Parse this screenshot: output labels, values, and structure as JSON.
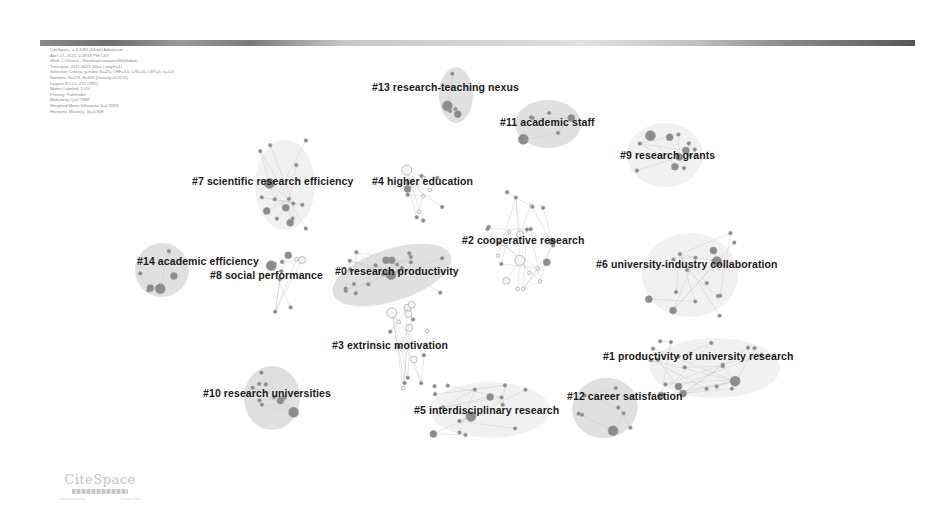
{
  "header": {
    "info_lines": [
      "CiteSpace, v. 6.3.R1 (64-bit) Advanced",
      "April 17, 2024, 4:49:59 PM CST",
      "WoS: C:\\Users\\...\\Desktop\\citespace\\WoS\\data",
      "Timespan: 2011-2023 (Slice Length=1)",
      "Selection Criteria: g-index (k=25), LRF=3.0, L/N=10, LBY=5, e=1.0",
      "Network: N=270, E=624 (Density=0.0172)",
      "Largest 8 CCs: 211 (78%)",
      "Nodes Labeled: 1.0%",
      "Pruning: Pathfinder",
      "Modularity Q=0.7988",
      "Weighted Mean Silhouette S=0.9283",
      "Harmonic Mean(Q, S)=0.858"
    ]
  },
  "clusters": [
    {
      "id": 0,
      "label": "#0 research productivity",
      "x": 335,
      "y": 265,
      "hull": {
        "cx": 392,
        "cy": 275,
        "rx": 62,
        "ry": 26,
        "rot": -18
      }
    },
    {
      "id": 1,
      "label": "#1 productivity of university research",
      "x": 603,
      "y": 350,
      "hull": {
        "cx": 715,
        "cy": 368,
        "rx": 65,
        "ry": 30,
        "rot": 0
      }
    },
    {
      "id": 2,
      "label": "#2 cooperative research",
      "x": 462,
      "y": 234,
      "hull": null
    },
    {
      "id": 3,
      "label": "#3 extrinsic motivation",
      "x": 332,
      "y": 339,
      "hull": null
    },
    {
      "id": 4,
      "label": "#4 higher education",
      "x": 372,
      "y": 175,
      "hull": null
    },
    {
      "id": 5,
      "label": "#5 interdisciplinary research",
      "x": 414,
      "y": 404,
      "hull": {
        "cx": 490,
        "cy": 410,
        "rx": 60,
        "ry": 28,
        "rot": 0
      }
    },
    {
      "id": 6,
      "label": "#6 university-industry collaboration",
      "x": 596,
      "y": 258,
      "hull": {
        "cx": 690,
        "cy": 275,
        "rx": 48,
        "ry": 42,
        "rot": 0
      }
    },
    {
      "id": 7,
      "label": "#7 scientific research efficiency",
      "x": 192,
      "y": 175,
      "hull": {
        "cx": 285,
        "cy": 185,
        "rx": 30,
        "ry": 45,
        "rot": 0
      }
    },
    {
      "id": 8,
      "label": "#8 social performance",
      "x": 210,
      "y": 269,
      "hull": null
    },
    {
      "id": 9,
      "label": "#9 research grants",
      "x": 620,
      "y": 149,
      "hull": {
        "cx": 665,
        "cy": 155,
        "rx": 38,
        "ry": 32,
        "rot": 0
      }
    },
    {
      "id": 10,
      "label": "#10 research universities",
      "x": 203,
      "y": 387,
      "hull": {
        "cx": 272,
        "cy": 398,
        "rx": 28,
        "ry": 32,
        "rot": 0
      }
    },
    {
      "id": 11,
      "label": "#11 academic staff",
      "x": 500,
      "y": 116,
      "hull": {
        "cx": 548,
        "cy": 124,
        "rx": 33,
        "ry": 24,
        "rot": 0
      }
    },
    {
      "id": 12,
      "label": "#12 career satisfaction",
      "x": 567,
      "y": 390,
      "hull": {
        "cx": 605,
        "cy": 408,
        "rx": 33,
        "ry": 30,
        "rot": -15
      }
    },
    {
      "id": 13,
      "label": "#13 research-teaching nexus",
      "x": 372,
      "y": 81,
      "hull": {
        "cx": 456,
        "cy": 95,
        "rx": 17,
        "ry": 28,
        "rot": 0
      }
    },
    {
      "id": 14,
      "label": "#14 academic efficiency",
      "x": 137,
      "y": 255,
      "hull": {
        "cx": 162,
        "cy": 270,
        "rx": 27,
        "ry": 27,
        "rot": 0
      }
    }
  ],
  "logo": {
    "text": "CiteSpace",
    "sub_left": "www.citespace.org",
    "sub_right": "Chaomei Chen"
  },
  "colors": {
    "hull": "#d6d6d6",
    "node": "#8c8c8c",
    "edge": "#cfcfcf",
    "label": "#1a1a1a"
  }
}
